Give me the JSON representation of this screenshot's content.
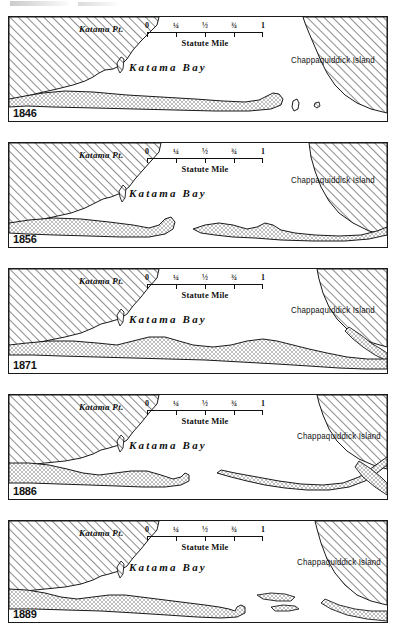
{
  "figure": {
    "panel_count": 5
  },
  "labels": {
    "katama_pt": "Katama Pt.",
    "katama_bay": "Katama Bay",
    "chappaquiddick": "Chappaquiddick Island"
  },
  "scale": {
    "caption": "Statute Mile",
    "ticks": [
      "0",
      "¼",
      "½",
      "¾",
      "1"
    ],
    "unit": "statute mile"
  },
  "colors": {
    "ink": "#1a1a1a",
    "hatch": "#6e6e6e",
    "stipple": "#4a4a4a",
    "water": "#ffffff",
    "paper": "#ffffff"
  },
  "panels": [
    {
      "year": "1846",
      "inlet_state": "open at east end",
      "description": "Long continuous barrier beach from Katama Pt. eastward with small detached islets near Chappaquiddick Island"
    },
    {
      "year": "1856",
      "inlet_state": "wide central breach",
      "description": "Barrier beach broken into a western hook and an eastern segment with a broad opening between"
    },
    {
      "year": "1871",
      "inlet_state": "closed",
      "description": "Unbroken barrier beach spanning the full width, bay fully enclosed"
    },
    {
      "year": "1886",
      "inlet_state": "narrow central opening",
      "description": "Two barrier segments nearly meeting at the middle with a narrow inlet"
    },
    {
      "year": "1889",
      "inlet_state": "open at east end",
      "description": "Barrier beach with recurved hook at the east end and detached shoal islets"
    }
  ]
}
